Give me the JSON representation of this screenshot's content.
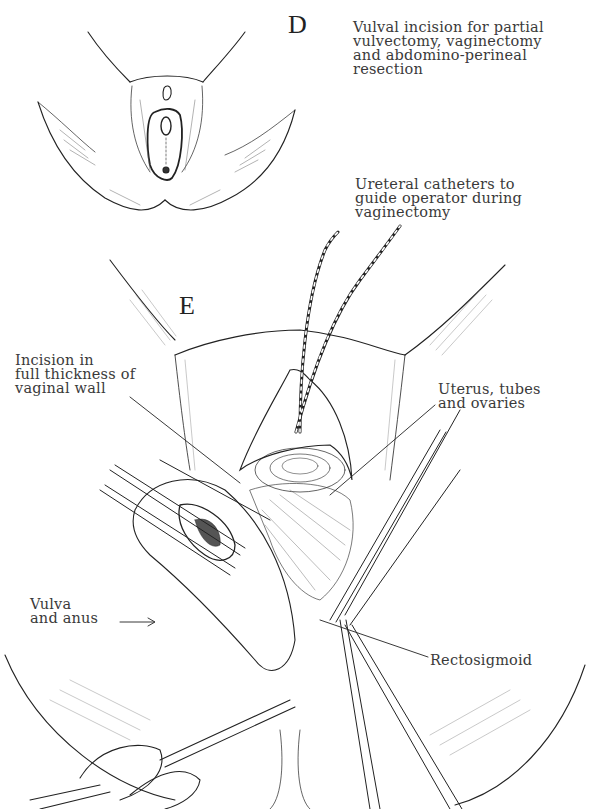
{
  "figure": {
    "panels": [
      {
        "id": "D",
        "letter": "D",
        "caption": "Vulval incision for partial\nvulvectomy, vaginectomy\nand abdomino-perineal\nresection"
      },
      {
        "id": "E",
        "letter": "E",
        "labels": {
          "ureteral_catheters": "Ureteral catheters to\nguide operator during\nvaginectomy",
          "incision_vaginal_wall": "Incision in\nfull thickness of\nvaginal wall",
          "uterus_tubes_ovaries": "Uterus, tubes\nand ovaries",
          "vulva_and_anus": "Vulva\nand anus",
          "rectosigmoid": "Rectosigmoid"
        }
      }
    ],
    "colors": {
      "ink": "#222222",
      "label_text": "#3a3a3a",
      "background": "#ffffff"
    }
  }
}
